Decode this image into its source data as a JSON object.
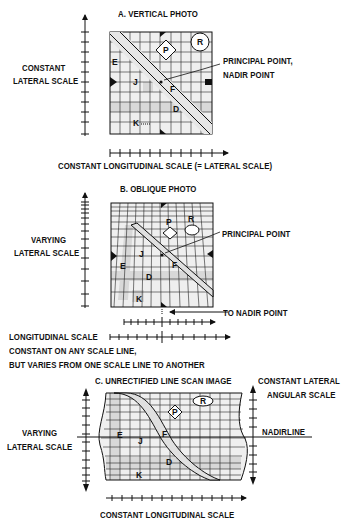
{
  "figure": {
    "panel_a": {
      "title": "A. VERTICAL PHOTO",
      "left_scale_label_1": "CONSTANT",
      "left_scale_label_2": "LATERAL SCALE",
      "callout_1": "PRINCIPAL POINT,",
      "callout_2": "NADIR POINT",
      "bottom_scale_label": "CONSTANT LONGITUDINAL SCALE (= LATERAL SCALE)",
      "points": [
        "P",
        "R",
        "E",
        "J",
        "F",
        "D",
        "K"
      ]
    },
    "panel_b": {
      "title": "B.  OBLIQUE PHOTO",
      "left_scale_label_1": "VARYING",
      "left_scale_label_2": "LATERAL SCALE",
      "callout": "PRINCIPAL POINT",
      "nadir_label": "TO NADIR POINT",
      "long_scale_label": "LONGITUDINAL SCALE",
      "note_1": "CONSTANT ON ANY SCALE LINE,",
      "note_2": "BUT VARIES FROM ONE SCALE LINE TO ANOTHER",
      "points": [
        "P",
        "R",
        "E",
        "J",
        "F",
        "D",
        "K"
      ]
    },
    "panel_c": {
      "title": "C. UNRECTIFIED LINE SCAN IMAGE",
      "right_scale_label_1": "CONSTANT LATERAL",
      "right_scale_label_2": "ANGULAR SCALE",
      "left_scale_label_1": "VARYING",
      "left_scale_label_2": "LATERAL SCALE",
      "nadirline_label": "NADIRLINE",
      "bottom_scale_label": "CONSTANT LONGITUDINAL SCALE",
      "points": [
        "P",
        "R",
        "E",
        "J",
        "F",
        "D",
        "K"
      ]
    }
  }
}
